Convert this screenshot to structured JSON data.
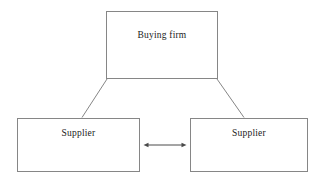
{
  "diagram": {
    "type": "triadic-relationship-diagram",
    "background_color": "#ffffff",
    "line_color": "#868686",
    "text_color": "#1a1a1a",
    "nodes": [
      {
        "id": "buying-firm",
        "label": "Buying firm"
      },
      {
        "id": "supplier-left",
        "label": "Supplier"
      },
      {
        "id": "supplier-right",
        "label": "Supplier"
      }
    ],
    "edges": [
      {
        "from": "buying-firm",
        "to": "supplier-left",
        "style": "plain-line",
        "arrow": "none"
      },
      {
        "from": "buying-firm",
        "to": "supplier-right",
        "style": "plain-line",
        "arrow": "none"
      },
      {
        "from": "supplier-left",
        "to": "supplier-right",
        "style": "plain-line",
        "arrow": "double"
      }
    ]
  }
}
